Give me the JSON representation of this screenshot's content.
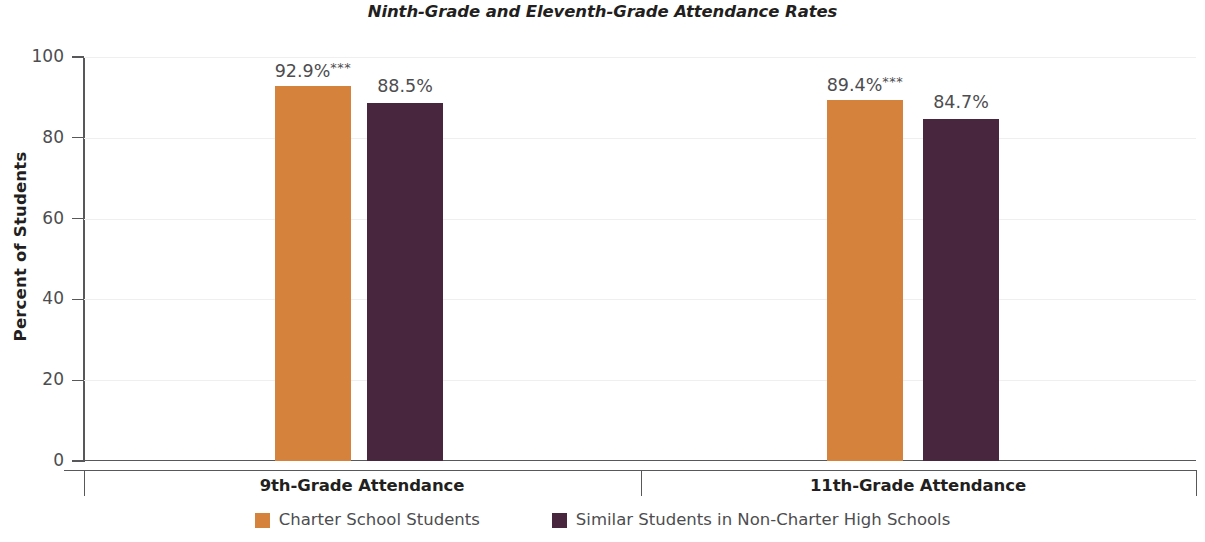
{
  "chart_data": {
    "type": "bar",
    "title": "Ninth-Grade and Eleventh-Grade Attendance Rates",
    "xlabel": "",
    "ylabel": "Percent of Students",
    "ylim": [
      0,
      100
    ],
    "yticks": [
      0,
      20,
      40,
      60,
      80,
      100
    ],
    "ytick_labels": [
      "0",
      "20",
      "40",
      "60",
      "80",
      "100"
    ],
    "grid": "faint-horizontal",
    "legend_position": "bottom-center",
    "categories": [
      "9th-Grade Attendance",
      "11th-Grade Attendance"
    ],
    "series": [
      {
        "name": "Charter School Students",
        "color": "#D5833C",
        "values": [
          92.9,
          89.4
        ],
        "labels": [
          "92.9%",
          "89.4%"
        ],
        "significance": [
          "***",
          "***"
        ]
      },
      {
        "name": "Similar Students in Non-Charter High Schools",
        "color": "#48273E",
        "values": [
          88.5,
          84.7
        ],
        "labels": [
          "88.5%",
          "84.7%"
        ],
        "significance": [
          "",
          ""
        ]
      }
    ]
  },
  "legend": {
    "items": [
      {
        "label": "Charter School Students",
        "color": "#D5833C"
      },
      {
        "label": "Similar Students in Non-Charter High Schools",
        "color": "#48273E"
      }
    ]
  }
}
